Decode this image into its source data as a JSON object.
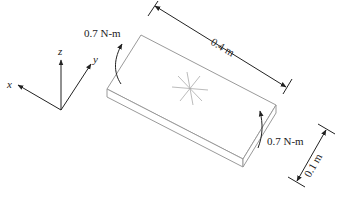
{
  "diagram": {
    "type": "plate-with-torques",
    "axes": {
      "x": "x",
      "y": "y",
      "z": "z"
    },
    "labels": {
      "length": "0.4 m",
      "width": "0.1 m",
      "torque_left": "0.7 N-m",
      "torque_right": "0.7 N-m"
    },
    "colors": {
      "plate": "#9a9a9a",
      "lines": "#222222",
      "star": "#aaaaaa"
    }
  }
}
